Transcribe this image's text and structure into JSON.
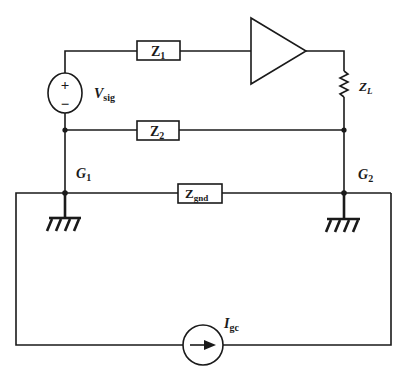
{
  "diagram": {
    "type": "circuit-schematic",
    "components": {
      "signal_source": {
        "name": "V",
        "subscript": "sig",
        "plus": "+",
        "minus": "−"
      },
      "z1": {
        "name": "Z",
        "subscript": "1"
      },
      "z2": {
        "name": "Z",
        "subscript": "2"
      },
      "zl": {
        "name": "Z",
        "subscript": "L"
      },
      "zgnd": {
        "name": "Z",
        "subscript": "gnd"
      },
      "amplifier": {
        "symbol": "triangle"
      },
      "current_source": {
        "name": "I",
        "subscript": "gc"
      }
    },
    "nodes": {
      "g1": {
        "name": "G",
        "subscript": "1"
      },
      "g2": {
        "name": "G",
        "subscript": "2"
      }
    },
    "colors": {
      "line": "#1a1a1a",
      "background": "#ffffff"
    }
  }
}
